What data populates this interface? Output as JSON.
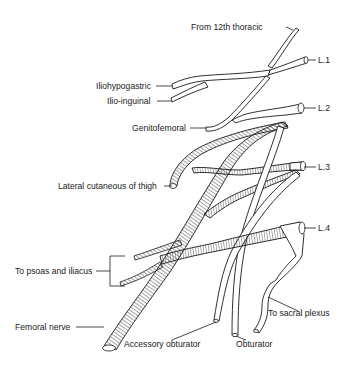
{
  "figure": {
    "labels": {
      "from_12th_thoracic": "From 12th thoracic",
      "l1": "L.1",
      "iliohypogastric": "Iliohypogastric",
      "ilio_inguinal": "Ilio-inguinal",
      "l2": "L.2",
      "genitofemoral": "Genitofemoral",
      "l3": "L.3",
      "lateral_cutaneous": "Lateral cutaneous of thigh",
      "l4": "L.4",
      "psoas_iliacus": "To psoas and iliacus",
      "sacral_plexus": "To sacral plexus",
      "femoral": "Femoral nerve",
      "accessory_obturator": "Accessory obturator",
      "obturator": "Obturator"
    }
  }
}
